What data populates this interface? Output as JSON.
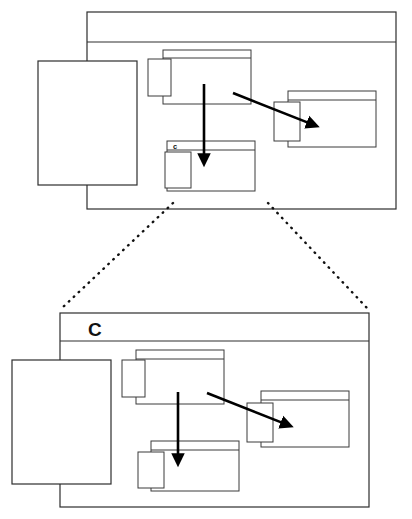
{
  "figure": {
    "type": "zoom-detail-diagram",
    "background_color": "#ffffff",
    "line_color": "#2e2e2e",
    "arrow_color": "#000000"
  },
  "overview": {
    "name": "overview-window",
    "label": "c",
    "label_location": "inner-bottom-window-titlebar",
    "frame": {
      "x": 87,
      "y": 12,
      "width": 309,
      "height": 197
    },
    "titlebar": {
      "height": 30
    },
    "windows": [
      {
        "name": "left-panel",
        "x": 38,
        "y": 61,
        "width": 99,
        "height": 124,
        "has_titlebar": false
      },
      {
        "name": "top-center-window",
        "x": 163,
        "y": 50,
        "width": 88,
        "height": 54,
        "has_titlebar": true
      },
      {
        "name": "top-center-badge",
        "x": 148,
        "y": 59,
        "width": 23,
        "height": 37,
        "has_titlebar": false
      },
      {
        "name": "right-window",
        "x": 288,
        "y": 91,
        "width": 88,
        "height": 56,
        "has_titlebar": true
      },
      {
        "name": "right-badge",
        "x": 274,
        "y": 102,
        "width": 26,
        "height": 39,
        "has_titlebar": false
      },
      {
        "name": "bottom-center-window",
        "x": 167,
        "y": 141,
        "width": 88,
        "height": 50,
        "has_titlebar": true
      },
      {
        "name": "bottom-center-badge",
        "x": 165,
        "y": 152,
        "width": 26,
        "height": 36,
        "has_titlebar": false
      }
    ],
    "arrows": [
      {
        "name": "vertical-arrow",
        "x1": 204,
        "y1": 84,
        "x2": 204,
        "y2": 163
      },
      {
        "name": "diagonal-arrow",
        "x1": 233,
        "y1": 93,
        "x2": 317,
        "y2": 126
      }
    ]
  },
  "detail": {
    "name": "detail-window",
    "label": "C",
    "label_location": "titlebar",
    "frame": {
      "x": 60,
      "y": 313,
      "width": 309,
      "height": 194
    },
    "titlebar": {
      "height": 28
    },
    "windows": [
      {
        "name": "left-panel",
        "x": 12,
        "y": 360,
        "width": 99,
        "height": 124,
        "has_titlebar": false
      },
      {
        "name": "top-center-window",
        "x": 136,
        "y": 350,
        "width": 88,
        "height": 54,
        "has_titlebar": true
      },
      {
        "name": "top-center-badge",
        "x": 122,
        "y": 360,
        "width": 23,
        "height": 37,
        "has_titlebar": false
      },
      {
        "name": "right-window",
        "x": 261,
        "y": 391,
        "width": 88,
        "height": 56,
        "has_titlebar": true
      },
      {
        "name": "right-badge",
        "x": 247,
        "y": 403,
        "width": 26,
        "height": 39,
        "has_titlebar": false
      },
      {
        "name": "bottom-center-window",
        "x": 151,
        "y": 441,
        "width": 88,
        "height": 50,
        "has_titlebar": true
      },
      {
        "name": "bottom-center-badge",
        "x": 138,
        "y": 452,
        "width": 26,
        "height": 36,
        "has_titlebar": false
      }
    ],
    "arrows": [
      {
        "name": "vertical-arrow",
        "x1": 178,
        "y1": 392,
        "x2": 178,
        "y2": 463
      },
      {
        "name": "diagonal-arrow",
        "x1": 207,
        "y1": 393,
        "x2": 291,
        "y2": 426
      }
    ]
  },
  "zoom_lines": [
    {
      "name": "zoom-line-left",
      "x1": 173,
      "y1": 203,
      "x2": 62,
      "y2": 308
    },
    {
      "name": "zoom-line-right",
      "x1": 268,
      "y1": 203,
      "x2": 367,
      "y2": 308
    }
  ]
}
